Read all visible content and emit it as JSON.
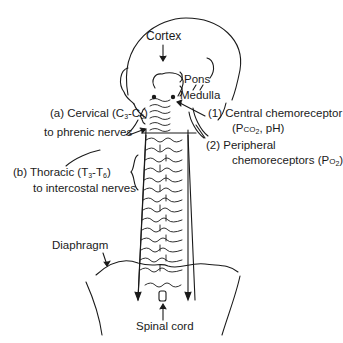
{
  "diagram": {
    "labels": {
      "cortex": "Cortex",
      "pons": "Pons",
      "medulla": "Medulla",
      "cervical": {
        "prefix": "(a) Cervical (C",
        "sub1": "3",
        "mid": "-C",
        "sub2": "5",
        "suffix": ")"
      },
      "phrenic": "to phrenic nerves",
      "thoracic": {
        "prefix": "(b) Thoracic (T",
        "sub1": "3",
        "mid": "-T",
        "sub2": "6",
        "suffix": ")"
      },
      "intercostal": "to intercostal nerves",
      "central_chemo": {
        "line1": "(1)  Central chemoreceptor",
        "line2_prefix": "(P",
        "line2_sub": "CO",
        "line2_sub2": "2",
        "line2_suffix": ", pH)"
      },
      "peripheral_chemo": {
        "line1": "(2)  Peripheral",
        "line2_prefix": "chemoreceptors (P",
        "line2_sub": "O",
        "line2_sub2": "2",
        "line2_suffix": ")"
      },
      "diaphragm": "Diaphragm",
      "spinal_cord": "Spinal cord"
    },
    "colors": {
      "ink": "#1a1a1a",
      "background": "#ffffff"
    }
  }
}
